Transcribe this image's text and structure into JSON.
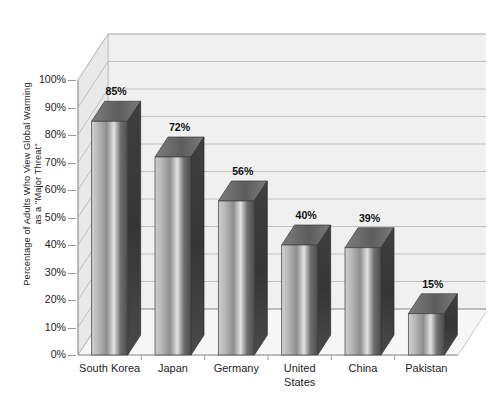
{
  "chart_data": {
    "type": "bar",
    "title": "",
    "subtitle": "",
    "xlabel": "",
    "ylabel": "Percentage of Adults Who View Global Warming as a \"Major Threat\"",
    "ylabel_lines": [
      "Percentage of Adults Who View Global Warming",
      "as a \"Major Threat\""
    ],
    "categories": [
      "South Korea",
      "Japan",
      "Germany",
      "United States",
      "China",
      "Pakistan"
    ],
    "values": [
      85,
      72,
      56,
      40,
      39,
      15
    ],
    "value_labels": [
      "85%",
      "72%",
      "56%",
      "40%",
      "39%",
      "15%"
    ],
    "ylim": [
      0,
      100
    ],
    "ytick_values": [
      0,
      10,
      20,
      30,
      40,
      50,
      60,
      70,
      80,
      90,
      100
    ],
    "ytick_labels": [
      "0%",
      "10%",
      "20%",
      "30%",
      "40%",
      "50%",
      "60%",
      "70%",
      "80%",
      "90%",
      "100%"
    ],
    "grid": true,
    "grid_axis": "y",
    "legend": false,
    "legend_position": "none",
    "style": "3d-column-grayscale",
    "bar_fill_light": "#d9d9d9",
    "bar_fill_dark": "#4a4a4a",
    "bar_top_face": "#6e6e6e",
    "bar_side_face": "#3a3a3a",
    "wall_color": "#f0f0f0",
    "floor_color": "#f7f7f7",
    "grid_color": "#b4b4b4",
    "axis_color": "#8f8f8f",
    "text_color": "#1d1d1d",
    "background": "#ffffff"
  }
}
